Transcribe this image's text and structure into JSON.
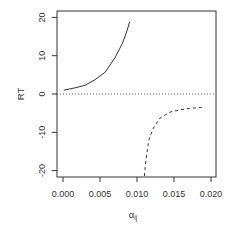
{
  "chart_data": {
    "type": "line",
    "title": "",
    "xlabel": "α_ij",
    "xlabel_main": "α",
    "xlabel_sub": "ij",
    "ylabel": "RT",
    "xlim": [
      0.0,
      0.02
    ],
    "ylim": [
      -22,
      20
    ],
    "x_ticks": [
      "0.000",
      "0.005",
      "0.010",
      "0.015",
      "0.020"
    ],
    "y_ticks": [
      "-20",
      "-10",
      "0",
      "10",
      "20"
    ],
    "grid": false,
    "legend": null,
    "reference_line": {
      "y": 0,
      "style": "dotted"
    },
    "series": [
      {
        "name": "positive branch",
        "style": "solid",
        "x": [
          0.0001,
          0.0016,
          0.003,
          0.0043,
          0.0057,
          0.007,
          0.008,
          0.0086,
          0.009
        ],
        "y": [
          1.0,
          1.6,
          2.3,
          3.7,
          5.7,
          9.4,
          13.1,
          16.2,
          18.8
        ]
      },
      {
        "name": "negative branch",
        "style": "dashed",
        "x": [
          0.011,
          0.0112,
          0.0116,
          0.0122,
          0.0131,
          0.0145,
          0.0165,
          0.0192
        ],
        "y": [
          -21.4,
          -17.2,
          -12.0,
          -8.9,
          -6.3,
          -4.7,
          -3.9,
          -3.4
        ]
      }
    ]
  }
}
